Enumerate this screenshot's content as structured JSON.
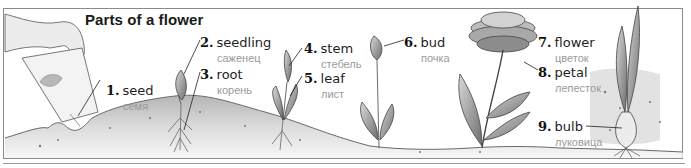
{
  "title": "Parts of a flower",
  "labels": [
    {
      "num": "1.",
      "en": "seed",
      "ru": "семя"
    },
    {
      "num": "2.",
      "en": "seedling",
      "ru": "саженец"
    },
    {
      "num": "3.",
      "en": "root",
      "ru": "корень"
    },
    {
      "num": "4.",
      "en": "stem",
      "ru": "стебель"
    },
    {
      "num": "5.",
      "en": "leaf",
      "ru": "лист"
    },
    {
      "num": "6.",
      "en": "bud",
      "ru": "почка"
    },
    {
      "num": "7.",
      "en": "flower",
      "ru": "цветок"
    },
    {
      "num": "8.",
      "en": "petal",
      "ru": "лепесток"
    },
    {
      "num": "9.",
      "en": "bulb",
      "ru": "луковица"
    }
  ],
  "colors": {
    "frame": "#8a8a8a",
    "ink": "#1e1e1e",
    "translation": "#9a9a9a",
    "soil": "#b5b5b5"
  }
}
